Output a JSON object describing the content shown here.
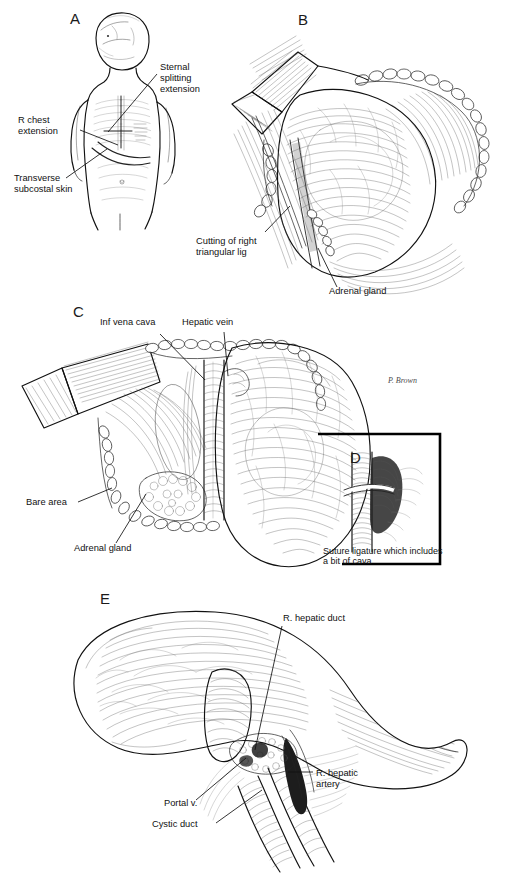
{
  "figure": {
    "background_color": "#ffffff",
    "ink_color": "#111111",
    "width": 528,
    "height": 880,
    "artist_signature": "P. Brown"
  },
  "panels": [
    {
      "id": "A",
      "letter": "A",
      "letter_x": 70,
      "letter_y": 24,
      "caption": "Infant torso showing planned skin incisions",
      "labels": [
        {
          "id": "sternal-splitting-extension",
          "text_lines": [
            "Sternal",
            "splitting",
            "extension"
          ],
          "x": 160,
          "y": 70
        },
        {
          "id": "r-chest-extension",
          "text_lines": [
            "R chest",
            "extension"
          ],
          "x": 18,
          "y": 123
        },
        {
          "id": "transverse-subcostal-skin",
          "text_lines": [
            "Transverse",
            "subcostal skin"
          ],
          "x": 14,
          "y": 181
        }
      ]
    },
    {
      "id": "B",
      "letter": "B",
      "letter_x": 298,
      "letter_y": 25,
      "caption": "Mobilization of the right lobe; division of right triangular ligament",
      "labels": [
        {
          "id": "cutting-of-right-triangular-lig",
          "text_lines": [
            "Cutting of right",
            "triangular lig"
          ],
          "x": 196,
          "y": 244
        },
        {
          "id": "adrenal-gland-b",
          "text_lines": [
            "Adrenal gland"
          ],
          "x": 329,
          "y": 294
        }
      ]
    },
    {
      "id": "C",
      "letter": "C",
      "letter_x": 73,
      "letter_y": 317,
      "caption": "Exposure of inferior vena cava, hepatic vein, bare area and adrenal gland",
      "labels": [
        {
          "id": "inf-vena-cava",
          "text_lines": [
            "Inf  vena cava"
          ],
          "x": 106,
          "y": 325
        },
        {
          "id": "hepatic-vein",
          "text_lines": [
            "Hepatic vein"
          ],
          "x": 186,
          "y": 325
        },
        {
          "id": "bare-area",
          "text_lines": [
            "Bare  area"
          ],
          "x": 28,
          "y": 505
        },
        {
          "id": "adrenal-gland-c",
          "text_lines": [
            "Adrenal gland"
          ],
          "x": 78,
          "y": 551
        }
      ]
    },
    {
      "id": "D",
      "letter": "D",
      "letter_x": 350,
      "letter_y": 463,
      "caption": "Inset detail of suture ligature on the vena cava",
      "bracket": {
        "x": 318,
        "y": 433,
        "width": 122,
        "height": 132
      },
      "labels": [
        {
          "id": "suture-ligature-caption",
          "text_lines": [
            "Suture  ligature which includes",
            "a bit of cava"
          ],
          "x": 323,
          "y": 554
        }
      ]
    },
    {
      "id": "E",
      "letter": "E",
      "letter_x": 100,
      "letter_y": 604,
      "caption": "Porta hepatis dissection showing right hepatic duct, artery, portal vein and cystic duct",
      "labels": [
        {
          "id": "r-hepatic-duct",
          "text_lines": [
            "R. hepatic duct"
          ],
          "x": 283,
          "y": 621
        },
        {
          "id": "r-hepatic-artery",
          "text_lines": [
            "R. hepatic",
            "artery"
          ],
          "x": 317,
          "y": 775
        },
        {
          "id": "portal-v",
          "text_lines": [
            "Portal v."
          ],
          "x": 166,
          "y": 806
        },
        {
          "id": "cystic-duct",
          "text_lines": [
            "Cystic duct"
          ],
          "x": 153,
          "y": 827
        }
      ]
    }
  ]
}
